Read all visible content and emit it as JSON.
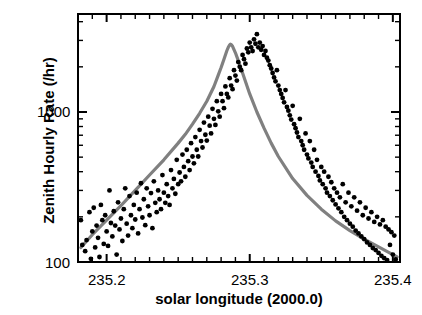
{
  "chart_data": {
    "type": "scatter",
    "title": "",
    "xlabel": "solar longitude  (2000.0)",
    "ylabel": "Zenith Hourly Rate (/hr)",
    "xlim": [
      235.18,
      235.405
    ],
    "ylim": [
      100,
      4500
    ],
    "yscale": "log",
    "grid": false,
    "legend": "none",
    "xticks": [
      235.2,
      235.3,
      235.4
    ],
    "xtick_labels": [
      "235.2",
      "235.3",
      "235.4"
    ],
    "xminor_step": 0.01,
    "yticks": [
      100,
      1000
    ],
    "ytick_labels": [
      "100",
      "1000"
    ],
    "marker_color": "#000000",
    "curve_color": "#808080",
    "axis_color": "#000000",
    "background_color": "#ffffff",
    "series": [
      {
        "name": "Observed ZHR",
        "type": "scatter",
        "x": [
          235.182,
          235.183,
          235.185,
          235.186,
          235.188,
          235.189,
          235.19,
          235.191,
          235.192,
          235.193,
          235.194,
          235.195,
          235.196,
          235.197,
          235.198,
          235.199,
          235.2,
          235.201,
          235.202,
          235.203,
          235.204,
          235.205,
          235.206,
          235.207,
          235.208,
          235.209,
          235.21,
          235.211,
          235.212,
          235.213,
          235.214,
          235.215,
          235.216,
          235.217,
          235.218,
          235.219,
          235.22,
          235.221,
          235.222,
          235.223,
          235.224,
          235.225,
          235.226,
          235.227,
          235.228,
          235.229,
          235.23,
          235.231,
          235.232,
          235.233,
          235.234,
          235.235,
          235.236,
          235.237,
          235.238,
          235.239,
          235.24,
          235.241,
          235.242,
          235.243,
          235.244,
          235.245,
          235.246,
          235.247,
          235.248,
          235.249,
          235.25,
          235.251,
          235.252,
          235.253,
          235.254,
          235.255,
          235.256,
          235.257,
          235.258,
          235.259,
          235.26,
          235.261,
          235.262,
          235.263,
          235.264,
          235.265,
          235.266,
          235.267,
          235.268,
          235.269,
          235.27,
          235.271,
          235.272,
          235.273,
          235.274,
          235.275,
          235.276,
          235.277,
          235.278,
          235.279,
          235.28,
          235.281,
          235.282,
          235.283,
          235.284,
          235.285,
          235.286,
          235.287,
          235.288,
          235.289,
          235.29,
          235.291,
          235.292,
          235.293,
          235.294,
          235.295,
          235.296,
          235.297,
          235.298,
          235.299,
          235.3,
          235.301,
          235.302,
          235.303,
          235.304,
          235.305,
          235.306,
          235.307,
          235.308,
          235.309,
          235.31,
          235.311,
          235.312,
          235.313,
          235.314,
          235.315,
          235.316,
          235.317,
          235.318,
          235.319,
          235.32,
          235.321,
          235.322,
          235.323,
          235.324,
          235.325,
          235.326,
          235.327,
          235.328,
          235.329,
          235.33,
          235.331,
          235.332,
          235.333,
          235.334,
          235.335,
          235.336,
          235.337,
          235.338,
          235.339,
          235.34,
          235.341,
          235.342,
          235.343,
          235.344,
          235.345,
          235.346,
          235.347,
          235.348,
          235.349,
          235.35,
          235.351,
          235.352,
          235.353,
          235.354,
          235.355,
          235.356,
          235.357,
          235.358,
          235.359,
          235.36,
          235.361,
          235.362,
          235.363,
          235.364,
          235.365,
          235.366,
          235.367,
          235.368,
          235.369,
          235.37,
          235.371,
          235.372,
          235.373,
          235.374,
          235.375,
          235.376,
          235.377,
          235.378,
          235.379,
          235.38,
          235.381,
          235.382,
          235.383,
          235.384,
          235.385,
          235.386,
          235.387,
          235.388,
          235.389,
          235.39,
          235.391,
          235.392,
          235.393,
          235.394,
          235.395,
          235.396,
          235.397,
          235.398,
          235.399,
          235.4,
          235.401,
          235.402
        ],
        "y": [
          190,
          130,
          118,
          140,
          215,
          105,
          160,
          230,
          125,
          175,
          145,
          108,
          240,
          190,
          132,
          205,
          160,
          128,
          300,
          182,
          148,
          218,
          175,
          112,
          250,
          165,
          195,
          138,
          225,
          310,
          180,
          150,
          275,
          205,
          168,
          240,
          192,
          290,
          155,
          225,
          335,
          198,
          262,
          176,
          310,
          235,
          205,
          288,
          168,
          345,
          248,
          215,
          300,
          262,
          225,
          380,
          290,
          248,
          330,
          275,
          240,
          410,
          310,
          358,
          285,
          480,
          330,
          395,
          345,
          520,
          430,
          370,
          560,
          470,
          410,
          620,
          505,
          455,
          680,
          560,
          505,
          760,
          640,
          580,
          850,
          705,
          645,
          930,
          810,
          720,
          1050,
          900,
          820,
          1180,
          1010,
          930,
          1320,
          1180,
          1060,
          1480,
          1320,
          1250,
          1680,
          1500,
          1420,
          1900,
          1750,
          1620,
          2150,
          2000,
          1900,
          2400,
          2250,
          2100,
          2650,
          2500,
          2900,
          2700,
          2550,
          3050,
          2850,
          3300,
          2700,
          2900,
          2600,
          2750,
          2400,
          2550,
          2300,
          2200,
          2050,
          1950,
          1820,
          1700,
          1600,
          1900,
          1500,
          1400,
          1320,
          1240,
          1160,
          1400,
          1080,
          1020,
          950,
          890,
          1100,
          830,
          780,
          730,
          680,
          900,
          640,
          600,
          560,
          720,
          520,
          490,
          640,
          460,
          430,
          560,
          400,
          480,
          375,
          350,
          430,
          330,
          400,
          310,
          290,
          370,
          275,
          340,
          258,
          310,
          242,
          290,
          228,
          270,
          215,
          330,
          200,
          250,
          190,
          290,
          180,
          235,
          172,
          270,
          162,
          220,
          155,
          250,
          148,
          205,
          142,
          230,
          135,
          195,
          130,
          215,
          124,
          185,
          120,
          200,
          115,
          178,
          110,
          190,
          106,
          172,
          103,
          165,
          130,
          158,
          112,
          150,
          104
        ]
      },
      {
        "name": "Fitted profile",
        "type": "line",
        "x": [
          235.182,
          235.19,
          235.2,
          235.21,
          235.22,
          235.23,
          235.24,
          235.25,
          235.255,
          235.26,
          235.265,
          235.27,
          235.275,
          235.278,
          235.28,
          235.282,
          235.284,
          235.285,
          235.286,
          235.2865,
          235.287,
          235.288,
          235.29,
          235.292,
          235.295,
          235.3,
          235.305,
          235.31,
          235.315,
          235.32,
          235.33,
          235.34,
          235.35,
          235.36,
          235.37,
          235.38,
          235.39,
          235.4,
          235.403
        ],
        "y": [
          125,
          152,
          190,
          238,
          300,
          380,
          480,
          620,
          710,
          830,
          980,
          1180,
          1480,
          1760,
          1980,
          2250,
          2560,
          2700,
          2800,
          2830,
          2820,
          2740,
          2480,
          2200,
          1820,
          1320,
          1000,
          780,
          620,
          505,
          360,
          278,
          225,
          188,
          162,
          142,
          126,
          112,
          108
        ]
      }
    ]
  },
  "axis": {
    "y_major_labels": [
      "1000",
      "100"
    ],
    "x_major_labels": [
      "235.2",
      "235.3",
      "235.4"
    ]
  }
}
